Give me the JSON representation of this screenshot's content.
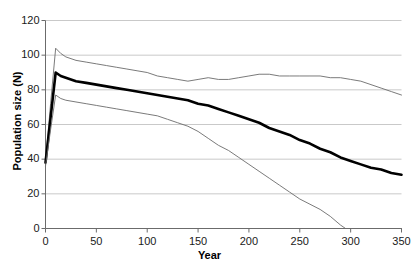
{
  "chart_data": {
    "type": "line",
    "title": "",
    "xlabel": "Year",
    "ylabel": "Population size (N)",
    "xlim": [
      0,
      350
    ],
    "ylim": [
      0,
      120
    ],
    "xticks": [
      0,
      50,
      100,
      150,
      200,
      250,
      300,
      350
    ],
    "yticks": [
      0,
      20,
      40,
      60,
      80,
      100,
      120
    ],
    "grid": "horizontal",
    "legend": "none",
    "series": [
      {
        "name": "upper-confidence-line",
        "style": "thin",
        "color": "#6b6b6b",
        "x": [
          0,
          5,
          10,
          15,
          20,
          30,
          40,
          50,
          60,
          70,
          80,
          90,
          100,
          110,
          120,
          130,
          140,
          150,
          160,
          170,
          180,
          190,
          200,
          210,
          220,
          230,
          240,
          250,
          260,
          270,
          280,
          290,
          300,
          310,
          320,
          330,
          340,
          350
        ],
        "y": [
          38,
          72,
          104,
          101,
          99,
          97,
          96,
          95,
          94,
          93,
          92,
          91,
          90,
          88,
          87,
          86,
          85,
          86,
          87,
          86,
          86,
          87,
          88,
          89,
          89,
          88,
          88,
          88,
          88,
          88,
          87,
          87,
          86,
          85,
          83,
          81,
          79,
          77
        ]
      },
      {
        "name": "mean-line",
        "style": "thick",
        "color": "#000000",
        "x": [
          0,
          5,
          10,
          15,
          20,
          30,
          40,
          50,
          60,
          70,
          80,
          90,
          100,
          110,
          120,
          130,
          140,
          150,
          160,
          170,
          180,
          190,
          200,
          210,
          220,
          230,
          240,
          250,
          260,
          270,
          280,
          290,
          300,
          310,
          320,
          330,
          340,
          350
        ],
        "y": [
          38,
          64,
          90,
          88,
          87,
          85,
          84,
          83,
          82,
          81,
          80,
          79,
          78,
          77,
          76,
          75,
          74,
          72,
          71,
          69,
          67,
          65,
          63,
          61,
          58,
          56,
          54,
          51,
          49,
          46,
          44,
          41,
          39,
          37,
          35,
          34,
          32,
          31
        ]
      },
      {
        "name": "lower-confidence-line",
        "style": "thin",
        "color": "#6b6b6b",
        "x": [
          0,
          5,
          10,
          15,
          20,
          30,
          40,
          50,
          60,
          70,
          80,
          90,
          100,
          110,
          120,
          130,
          140,
          150,
          160,
          170,
          180,
          190,
          200,
          210,
          220,
          230,
          240,
          250,
          260,
          270,
          280,
          290,
          295,
          300,
          350
        ],
        "y": [
          36,
          57,
          77,
          75,
          74,
          73,
          72,
          71,
          70,
          69,
          68,
          67,
          66,
          65,
          63,
          61,
          59,
          56,
          52,
          48,
          45,
          41,
          37,
          33,
          29,
          25,
          21,
          17,
          14,
          11,
          7,
          2,
          0,
          0,
          0
        ]
      }
    ]
  },
  "axes": {
    "y_tick_labels": [
      "120",
      "100",
      "80",
      "60",
      "40",
      "20",
      "0"
    ],
    "x_tick_labels": [
      "0",
      "50",
      "100",
      "150",
      "200",
      "250",
      "300",
      "350"
    ],
    "x_title": "Year",
    "y_title": "Population size (N)"
  },
  "colors": {
    "gridline": "#c9c9c9",
    "axis": "#6b6b6b",
    "mean_line": "#000000",
    "ci_line": "#6b6b6b",
    "background": "#ffffff"
  }
}
